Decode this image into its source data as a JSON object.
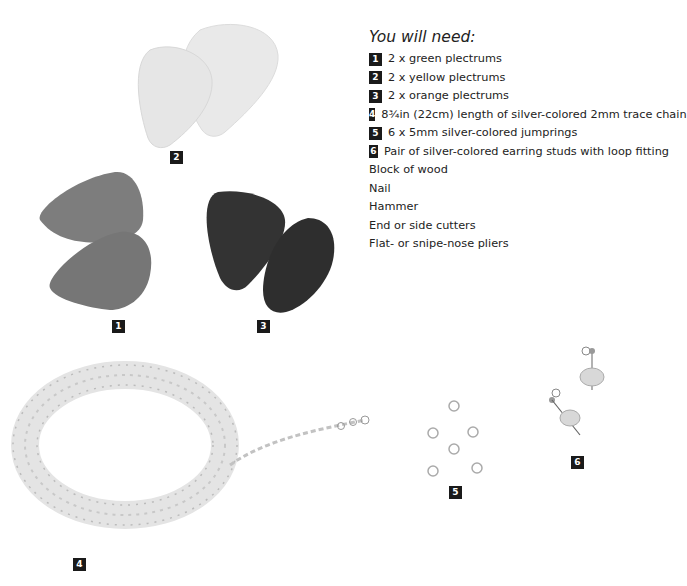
{
  "heading": "You will need:",
  "items": [
    {
      "num": "1",
      "text": "2 x green plectrums"
    },
    {
      "num": "2",
      "text": "2 x yellow plectrums"
    },
    {
      "num": "3",
      "text": "2 x orange plectrums"
    },
    {
      "num": "4",
      "text": "8¾in (22cm) length of silver-colored 2mm trace chain"
    },
    {
      "num": "5",
      "text": "6 x 5mm silver-colored  jumprings"
    },
    {
      "num": "6",
      "text": "Pair of silver-colored earring studs with loop fitting"
    },
    {
      "num": "",
      "text": "Block of wood"
    },
    {
      "num": "",
      "text": "Nail"
    },
    {
      "num": "",
      "text": "Hammer"
    },
    {
      "num": "",
      "text": "End or side cutters"
    },
    {
      "num": "",
      "text": "Flat- or snipe-nose pliers"
    }
  ],
  "labels": {
    "green": "1",
    "yellow": "2",
    "orange": "3",
    "chain": "4",
    "jumprings": "5",
    "studs": "6"
  },
  "colors": {
    "yellow_pick": "#e6e6e6",
    "green_pick": "#7a7a7a",
    "orange_pick": "#333333",
    "badge": "#1a1a1a"
  }
}
